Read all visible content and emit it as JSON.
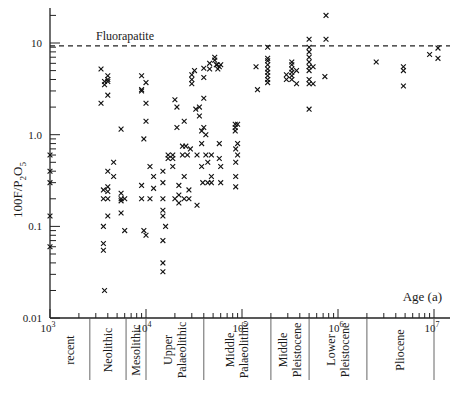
{
  "chart_data": {
    "type": "scatter",
    "title": "",
    "xlabel": "Age (a)",
    "ylabel": "100F/P2O5",
    "xscale": "log",
    "yscale": "log",
    "xlim": [
      1000,
      12000000
    ],
    "ylim": [
      0.01,
      25
    ],
    "x_ticks": [
      {
        "value": 1000,
        "label": "10",
        "exp": "3"
      },
      {
        "value": 10000,
        "label": "10",
        "exp": "4"
      },
      {
        "value": 100000,
        "label": "10",
        "exp": "5"
      },
      {
        "value": 1000000,
        "label": "10",
        "exp": "6"
      },
      {
        "value": 10000000,
        "label": "10",
        "exp": "7"
      }
    ],
    "y_ticks": [
      {
        "value": 10,
        "label": "10"
      },
      {
        "value": 1,
        "label": "1.0"
      },
      {
        "value": 0.1,
        "label": "0.1"
      },
      {
        "value": 0.01,
        "label": "0.01"
      }
    ],
    "grid": false,
    "reference_line": {
      "label": "Fluorapatite",
      "y": 9.3,
      "style": "dashed"
    },
    "periods": [
      {
        "label": "recent",
        "from": 1000,
        "to": 2600
      },
      {
        "label": "Neolithic",
        "from": 2600,
        "to": 6200
      },
      {
        "label": "Mesolithic",
        "from": 6200,
        "to": 10000
      },
      {
        "label": "Upper Palaeolithic",
        "from": 10000,
        "to": 40000
      },
      {
        "label": "Middle Palaeolithic",
        "from": 40000,
        "to": 200000
      },
      {
        "label": "Middle Pleistocene",
        "from": 200000,
        "to": 500000
      },
      {
        "label": "Lower Pleistocene",
        "from": 500000,
        "to": 2000000
      },
      {
        "label": "Pliocene",
        "from": 2000000,
        "to": 10000000
      }
    ],
    "series": [
      {
        "name": "samples",
        "marker": "x",
        "points": [
          [
            1000,
            0.6
          ],
          [
            1000,
            0.4
          ],
          [
            1000,
            0.3
          ],
          [
            1000,
            0.13
          ],
          [
            1000,
            0.06
          ],
          [
            3400,
            5.2
          ],
          [
            3400,
            2.2
          ],
          [
            3700,
            3.8
          ],
          [
            3700,
            3.5
          ],
          [
            4000,
            4.0
          ],
          [
            4000,
            4.4
          ],
          [
            4000,
            3.8
          ],
          [
            4000,
            2.7
          ],
          [
            3600,
            0.25
          ],
          [
            3600,
            0.2
          ],
          [
            3600,
            0.1
          ],
          [
            3600,
            0.065
          ],
          [
            3600,
            0.055
          ],
          [
            3700,
            0.02
          ],
          [
            4000,
            0.4
          ],
          [
            4000,
            0.27
          ],
          [
            4000,
            0.24
          ],
          [
            4000,
            0.2
          ],
          [
            4000,
            0.13
          ],
          [
            4600,
            0.5
          ],
          [
            4600,
            0.35
          ],
          [
            5500,
            0.23
          ],
          [
            5500,
            0.2
          ],
          [
            5500,
            0.19
          ],
          [
            5500,
            0.14
          ],
          [
            6000,
            0.2
          ],
          [
            6000,
            0.09
          ],
          [
            5500,
            1.15
          ],
          [
            9000,
            4.4
          ],
          [
            9000,
            3.1
          ],
          [
            9000,
            3.0
          ],
          [
            10000,
            3.7
          ],
          [
            10000,
            2.2
          ],
          [
            10000,
            1.4
          ],
          [
            9500,
            0.9
          ],
          [
            9000,
            0.28
          ],
          [
            9000,
            0.2
          ],
          [
            9500,
            0.09
          ],
          [
            10000,
            0.08
          ],
          [
            11000,
            0.2
          ],
          [
            11000,
            0.45
          ],
          [
            12000,
            0.35
          ],
          [
            12000,
            0.26
          ],
          [
            15000,
            0.2
          ],
          [
            15000,
            0.15
          ],
          [
            15000,
            0.4
          ],
          [
            15000,
            0.3
          ],
          [
            16000,
            0.1
          ],
          [
            15000,
            0.13
          ],
          [
            15000,
            0.07
          ],
          [
            15000,
            0.04
          ],
          [
            15000,
            0.032
          ],
          [
            17000,
            0.6
          ],
          [
            17000,
            0.55
          ],
          [
            19000,
            0.6
          ],
          [
            19000,
            0.55
          ],
          [
            19000,
            0.45
          ],
          [
            20000,
            0.2
          ],
          [
            20000,
            2.4
          ],
          [
            21000,
            2.0
          ],
          [
            21000,
            1.2
          ],
          [
            22000,
            0.28
          ],
          [
            22000,
            0.22
          ],
          [
            22000,
            0.18
          ],
          [
            24000,
            0.75
          ],
          [
            25000,
            1.4
          ],
          [
            24000,
            0.6
          ],
          [
            25000,
            0.35
          ],
          [
            25000,
            0.2
          ],
          [
            26000,
            0.75
          ],
          [
            27000,
            0.6
          ],
          [
            28000,
            0.2
          ],
          [
            28000,
            0.25
          ],
          [
            29000,
            0.7
          ],
          [
            30000,
            4.5
          ],
          [
            30000,
            4.0
          ],
          [
            30000,
            3.6
          ],
          [
            32000,
            5.0
          ],
          [
            33000,
            1.9
          ],
          [
            34000,
            0.6
          ],
          [
            34000,
            0.17
          ],
          [
            36000,
            2.0
          ],
          [
            36000,
            1.6
          ],
          [
            38000,
            1.1
          ],
          [
            38000,
            0.8
          ],
          [
            38000,
            0.45
          ],
          [
            39000,
            0.3
          ],
          [
            40000,
            5.3
          ],
          [
            40000,
            4.2
          ],
          [
            40000,
            2.5
          ],
          [
            40000,
            1.2
          ],
          [
            42000,
            1.0
          ],
          [
            42000,
            0.6
          ],
          [
            44000,
            0.5
          ],
          [
            44000,
            0.3
          ],
          [
            46000,
            6.0
          ],
          [
            46000,
            5.2
          ],
          [
            48000,
            0.6
          ],
          [
            48000,
            0.35
          ],
          [
            48000,
            0.3
          ],
          [
            52000,
            7.0
          ],
          [
            52000,
            6.5
          ],
          [
            54000,
            5.8
          ],
          [
            55000,
            5.8
          ],
          [
            56000,
            5.2
          ],
          [
            58000,
            5.5
          ],
          [
            60000,
            5.8
          ],
          [
            58000,
            0.8
          ],
          [
            58000,
            0.55
          ],
          [
            60000,
            0.45
          ],
          [
            60000,
            0.3
          ],
          [
            85000,
            1.3
          ],
          [
            85000,
            1.2
          ],
          [
            85000,
            1.1
          ],
          [
            86000,
            0.7
          ],
          [
            86000,
            0.5
          ],
          [
            86000,
            0.35
          ],
          [
            86000,
            0.27
          ],
          [
            90000,
            1.3
          ],
          [
            90000,
            0.8
          ],
          [
            90000,
            0.6
          ],
          [
            140000,
            5.5
          ],
          [
            145000,
            3.1
          ],
          [
            185000,
            9.0
          ],
          [
            185000,
            6.8
          ],
          [
            185000,
            6.4
          ],
          [
            185000,
            5.8
          ],
          [
            185000,
            5.2
          ],
          [
            185000,
            4.8
          ],
          [
            185000,
            4.4
          ],
          [
            185000,
            4.0
          ],
          [
            185000,
            3.7
          ],
          [
            330000,
            6.2
          ],
          [
            330000,
            5.8
          ],
          [
            330000,
            5.2
          ],
          [
            330000,
            4.8
          ],
          [
            330000,
            4.4
          ],
          [
            330000,
            4.0
          ],
          [
            290000,
            4.5
          ],
          [
            290000,
            4.0
          ],
          [
            370000,
            5.0
          ],
          [
            370000,
            3.6
          ],
          [
            500000,
            11.0
          ],
          [
            500000,
            9.0
          ],
          [
            500000,
            8.0
          ],
          [
            500000,
            7.0
          ],
          [
            500000,
            6.2
          ],
          [
            500000,
            5.5
          ],
          [
            500000,
            5.0
          ],
          [
            500000,
            4.0
          ],
          [
            500000,
            3.6
          ],
          [
            500000,
            1.9
          ],
          [
            550000,
            5.5
          ],
          [
            550000,
            3.6
          ],
          [
            750000,
            20.0
          ],
          [
            750000,
            11.0
          ],
          [
            730000,
            4.3
          ],
          [
            2500000,
            6.2
          ],
          [
            4800000,
            5.5
          ],
          [
            4800000,
            5.0
          ],
          [
            4800000,
            3.4
          ],
          [
            9000000,
            7.5
          ],
          [
            11000000,
            8.8
          ],
          [
            11000000,
            6.8
          ]
        ]
      }
    ]
  }
}
